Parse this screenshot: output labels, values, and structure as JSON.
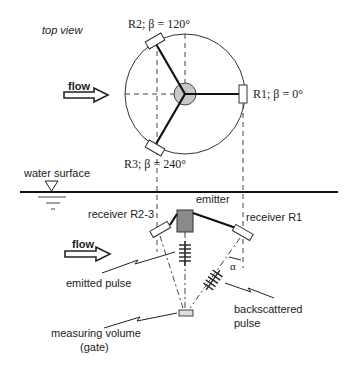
{
  "labels": {
    "top_view": "top view",
    "flow_top": "flow",
    "r2": "R2; β = 120°",
    "r1": "R1; β = 0°",
    "r3": "R3; β = 240°",
    "water_surface": "water surface",
    "emitter": "emitter",
    "receiver_r23": "receiver R2-3",
    "receiver_r1": "receiver R1",
    "flow_side": "flow",
    "alpha": "α",
    "emitted_pulse": "emitted pulse",
    "backscattered_line1": "backscattered",
    "backscattered_line2": "pulse",
    "measuring_line1": "measuring volume",
    "measuring_line2": "(gate)"
  },
  "colors": {
    "line": "#222222",
    "emitter_fill": "#8a8a8a",
    "hub_fill": "#c8c8c8"
  }
}
